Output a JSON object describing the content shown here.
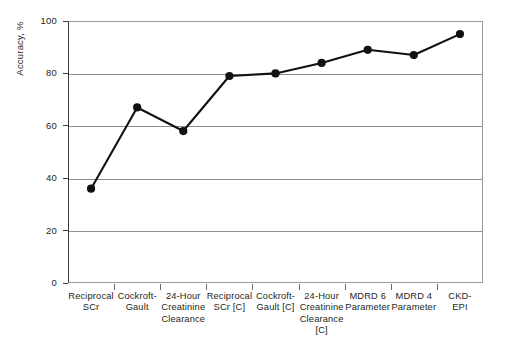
{
  "chart_data": {
    "type": "line",
    "title": "",
    "xlabel": "",
    "ylabel": "Accuracy, %",
    "categories": [
      "Reciprocal SCr",
      "Cockroft-Gault",
      "24-Hour Creatinine Clearance",
      "Reciprocal SCr [C]",
      "Cockroft-Gault [C]",
      "24-Hour Creatinine Clearance [C]",
      "MDRD 6 Parameter",
      "MDRD 4 Parameter",
      "CKD-EPI"
    ],
    "values": [
      36,
      67,
      58,
      79,
      80,
      84,
      89,
      87,
      95
    ],
    "ylim": [
      0,
      100
    ],
    "yticks": [
      0,
      20,
      40,
      60,
      80,
      100
    ],
    "ytick_labels": [
      "0",
      "20",
      "40",
      "60",
      "80",
      "100"
    ],
    "grid": true,
    "legend": "none",
    "marker": "filled-circle",
    "line_color": "#111111",
    "marker_color": "#111111",
    "grid_color": "#8d8d8d",
    "axis_color": "#3b3b3b"
  },
  "axis": {
    "y_title": "Accuracy, %"
  },
  "categories_wrapped": [
    [
      "Reciprocal",
      "SCr"
    ],
    [
      "Cockroft-",
      "Gault"
    ],
    [
      "24-Hour",
      "Creatinine",
      "Clearance"
    ],
    [
      "Reciprocal",
      "SCr [C]"
    ],
    [
      "Cockroft-",
      "Gault [C]"
    ],
    [
      "24-Hour",
      "Creatinine",
      "Clearance [C]"
    ],
    [
      "MDRD 6",
      "Parameter"
    ],
    [
      "MDRD 4",
      "Parameter"
    ],
    [
      "CKD-",
      "EPI"
    ]
  ]
}
